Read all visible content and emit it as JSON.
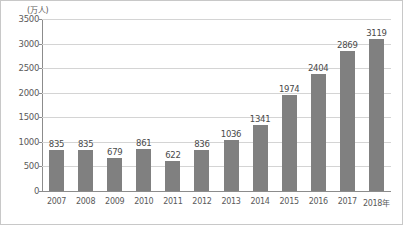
{
  "chart_data": {
    "type": "bar",
    "title": "",
    "subtitle": "",
    "xlabel": "",
    "ylabel": "(万人)",
    "unit_label": "(万人)",
    "categories": [
      "2007",
      "2008",
      "2009",
      "2010",
      "2011",
      "2012",
      "2013",
      "2014",
      "2015",
      "2016",
      "2017",
      "2018年"
    ],
    "values": [
      835,
      835,
      679,
      861,
      622,
      836,
      1036,
      1341,
      1974,
      2404,
      2869,
      3119
    ],
    "data_labels": [
      "835",
      "835",
      "679",
      "861",
      "622",
      "836",
      "1036",
      "1341",
      "1974",
      "2404",
      "2869",
      "3119"
    ],
    "ylim": [
      0,
      3500
    ],
    "ytick_values": [
      0,
      500,
      1000,
      1500,
      2000,
      2500,
      3000,
      3500
    ],
    "ytick_labels": [
      "0",
      "500",
      "1000",
      "1500",
      "2000",
      "2500",
      "3000",
      "3500"
    ],
    "grid": true,
    "legend": null,
    "legend_position": "none",
    "bar_color": "#808080",
    "grid_color": "#d4d4d4",
    "axis_color": "#8c8c8c",
    "border_color": "#c8c8c8",
    "label_color": "#5a5a5a"
  }
}
